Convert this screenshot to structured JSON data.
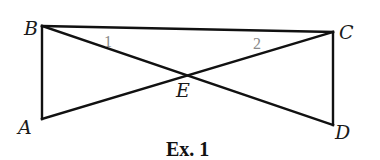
{
  "figure": {
    "caption": "Ex. 1",
    "points": {
      "A": {
        "label": "A",
        "x": 42,
        "y": 119
      },
      "B": {
        "label": "B",
        "x": 42,
        "y": 26
      },
      "C": {
        "label": "C",
        "x": 333,
        "y": 32
      },
      "D": {
        "label": "D",
        "x": 333,
        "y": 125
      },
      "E": {
        "label": "E",
        "x": 185,
        "y": 75
      }
    },
    "segments": [
      {
        "from": "B",
        "to": "C"
      },
      {
        "from": "B",
        "to": "A"
      },
      {
        "from": "A",
        "to": "C"
      },
      {
        "from": "B",
        "to": "D"
      },
      {
        "from": "C",
        "to": "D"
      }
    ],
    "angle_labels": [
      {
        "label": "1",
        "at": "B"
      },
      {
        "label": "2",
        "at": "C"
      }
    ],
    "colors": {
      "line": "#111111",
      "angle_label": "#8a8a8a",
      "background": "#ffffff"
    }
  }
}
